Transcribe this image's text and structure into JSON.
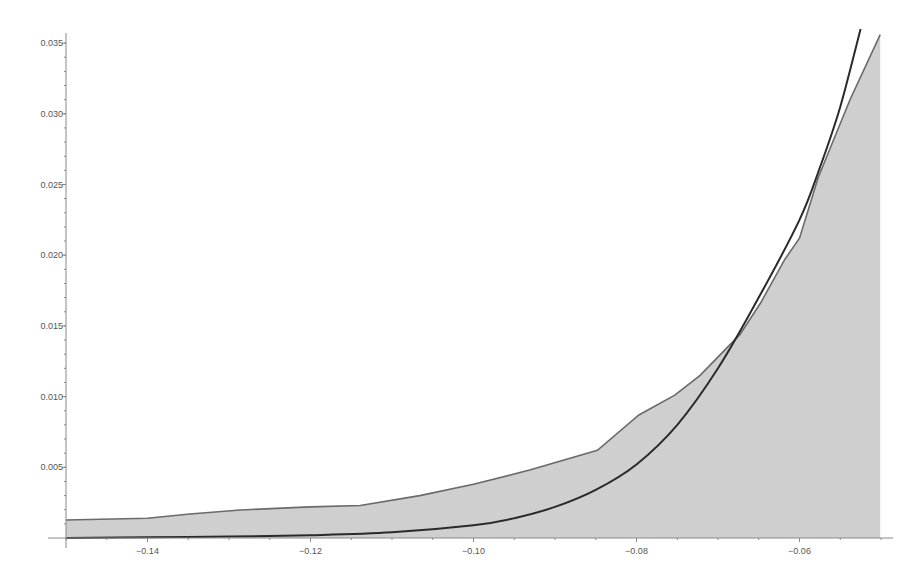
{
  "chart_data": {
    "type": "area",
    "title": "",
    "xlabel": "",
    "ylabel": "",
    "xlim": [
      -0.15,
      -0.05
    ],
    "ylim": [
      0,
      0.0355
    ],
    "grid": false,
    "legend": null,
    "x_ticks": [
      -0.14,
      -0.12,
      -0.1,
      -0.08,
      -0.06
    ],
    "x_tick_labels": [
      "−0.14",
      "−0.12",
      "−0.10",
      "−0.08",
      "−0.06"
    ],
    "y_ticks": [
      0.005,
      0.01,
      0.015,
      0.02,
      0.025,
      0.03,
      0.035
    ],
    "y_tick_labels": [
      "0.005",
      "0.010",
      "0.015",
      "0.020",
      "0.025",
      "0.030",
      "0.035"
    ],
    "series": [
      {
        "name": "empirical",
        "style": "filled-area",
        "color": "#cfcfcf",
        "line_color": "#6a6a6a",
        "x": [
          -0.15,
          -0.14,
          -0.1348,
          -0.1286,
          -0.12,
          -0.1139,
          -0.1066,
          -0.1,
          -0.0931,
          -0.0848,
          -0.0797,
          -0.0753,
          -0.0722,
          -0.0673,
          -0.0648,
          -0.0618,
          -0.06,
          -0.0577,
          -0.0538,
          -0.0501
        ],
        "values": [
          0.00127,
          0.0014,
          0.0017,
          0.00198,
          0.0022,
          0.0023,
          0.003,
          0.0038,
          0.0048,
          0.0062,
          0.0087,
          0.0101,
          0.0115,
          0.0144,
          0.0166,
          0.0197,
          0.0212,
          0.0255,
          0.031,
          0.0356
        ]
      },
      {
        "name": "fitted",
        "style": "line",
        "color": "#2a2a2a",
        "x": [
          -0.15,
          -0.14,
          -0.13,
          -0.12,
          -0.11,
          -0.1,
          -0.095,
          -0.09,
          -0.085,
          -0.08,
          -0.075,
          -0.07,
          -0.065,
          -0.06,
          -0.0575,
          -0.055,
          -0.0525
        ],
        "values": [
          0.0,
          5e-05,
          0.0001,
          0.0002,
          0.0004,
          0.0009,
          0.0014,
          0.0022,
          0.0034,
          0.0052,
          0.008,
          0.012,
          0.017,
          0.0225,
          0.0262,
          0.0305,
          0.036
        ]
      }
    ]
  }
}
